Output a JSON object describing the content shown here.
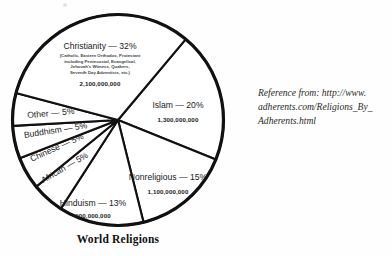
{
  "chart_data": {
    "type": "pie",
    "title": "World Religions",
    "categories": [
      "Islam",
      "Nonreligious",
      "Hinduism",
      "African",
      "Chinese",
      "Buddhism",
      "Other",
      "Christianity"
    ],
    "values": [
      20,
      15,
      13,
      5,
      5,
      5,
      5,
      32
    ],
    "unit": "percent",
    "legend": "none",
    "slices": [
      {
        "name": "Islam",
        "label": "Islam — 20%",
        "percent": 20,
        "adherents": "1,300,000,000",
        "sub": "",
        "start_angle": 40,
        "end_angle": 112
      },
      {
        "name": "Nonreligious",
        "label": "Nonreligious — 15%",
        "percent": 15,
        "adherents": "1,100,000,000",
        "sub": "",
        "start_angle": 112,
        "end_angle": 166
      },
      {
        "name": "Hinduism",
        "label": "Hinduism — 13%",
        "percent": 13,
        "adherents": "900,000,000",
        "sub": "",
        "start_angle": 166,
        "end_angle": 212.8
      },
      {
        "name": "African",
        "label": "African — 5%",
        "percent": 5,
        "adherents": "",
        "sub": "",
        "start_angle": 212.8,
        "end_angle": 230.8
      },
      {
        "name": "Chinese",
        "label": "Chinese — 5%",
        "percent": 5,
        "adherents": "",
        "sub": "",
        "start_angle": 230.8,
        "end_angle": 248.8
      },
      {
        "name": "Buddhism",
        "label": "Buddhism — 5%",
        "percent": 5,
        "adherents": "",
        "sub": "",
        "start_angle": 248.8,
        "end_angle": 266.8
      },
      {
        "name": "Other",
        "label": "Other — 5%",
        "percent": 5,
        "adherents": "",
        "sub": "",
        "start_angle": 266.8,
        "end_angle": 284.8
      },
      {
        "name": "Christianity",
        "label": "Christianity — 32%",
        "percent": 32,
        "adherents": "2,100,000,000",
        "sub": "(Catholic, Eastern Orthodox, Protestant\nincluding Pentecostal, Evangelical,\nJehovah's Witness, Quakers,\nSeventh Day Adventists, etc.)",
        "start_angle": 284.8,
        "end_angle": 400
      }
    ],
    "colors": {
      "slice_fill": "#ffffff",
      "slice_stroke": "#111111",
      "text": "#1a1a1a",
      "background": "#fefefe"
    }
  },
  "labels": {
    "christianity_main": "Christianity — 32%",
    "christianity_sub_1": "(Catholic, Eastern Orthodox, Protestant",
    "christianity_sub_2": "including Pentecostal, Evangelical,",
    "christianity_sub_3": "Jehovah's Witness, Quakers,",
    "christianity_sub_4": "Seventh Day Adventists, etc.)",
    "christianity_num": "2,100,000,000",
    "islam_main": "Islam — 20%",
    "islam_num": "1,300,000,000",
    "nonreligious_main": "Nonreligious — 15%",
    "nonreligious_num": "1,100,000,000",
    "hinduism_main": "Hinduism — 13%",
    "hinduism_num": "900,000,000",
    "african_main": "African — 5%",
    "chinese_main": "Chinese — 5%",
    "buddhism_main": "Buddhism — 5%",
    "other_main": "Other — 5%"
  },
  "title": "World Religions",
  "reference": {
    "line_1": "Reference from: http://www.",
    "line_2": "adherents.com/Religions_By_",
    "line_3": "Adherents.html"
  }
}
